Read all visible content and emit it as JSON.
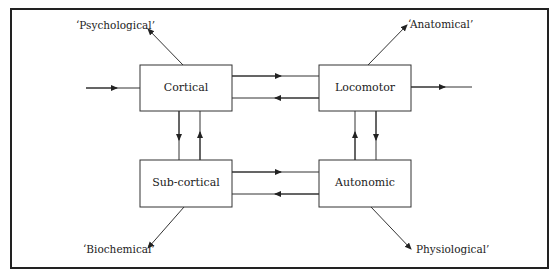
{
  "diagram": {
    "nodes": {
      "cortical": {
        "label": "Cortical"
      },
      "locomotor": {
        "label": "Locomotor"
      },
      "subcortical": {
        "label": "Sub-cortical"
      },
      "autonomic": {
        "label": "Autonomic"
      }
    },
    "outputs": {
      "psychological": {
        "label": "‘Psychological’"
      },
      "anatomical": {
        "label": "‘Anatomical’"
      },
      "biochemical": {
        "label": "‘Biochemical’"
      },
      "physiological": {
        "label": "Physiological’"
      }
    },
    "edges": [
      {
        "from": "input",
        "to": "cortical"
      },
      {
        "from": "cortical",
        "to": "locomotor"
      },
      {
        "from": "locomotor",
        "to": "cortical"
      },
      {
        "from": "locomotor",
        "to": "output"
      },
      {
        "from": "cortical",
        "to": "subcortical"
      },
      {
        "from": "subcortical",
        "to": "cortical"
      },
      {
        "from": "locomotor",
        "to": "autonomic"
      },
      {
        "from": "autonomic",
        "to": "locomotor"
      },
      {
        "from": "subcortical",
        "to": "autonomic"
      },
      {
        "from": "autonomic",
        "to": "subcortical"
      },
      {
        "from": "cortical",
        "to": "psychological"
      },
      {
        "from": "locomotor",
        "to": "anatomical"
      },
      {
        "from": "subcortical",
        "to": "biochemical"
      },
      {
        "from": "autonomic",
        "to": "physiological"
      }
    ]
  }
}
